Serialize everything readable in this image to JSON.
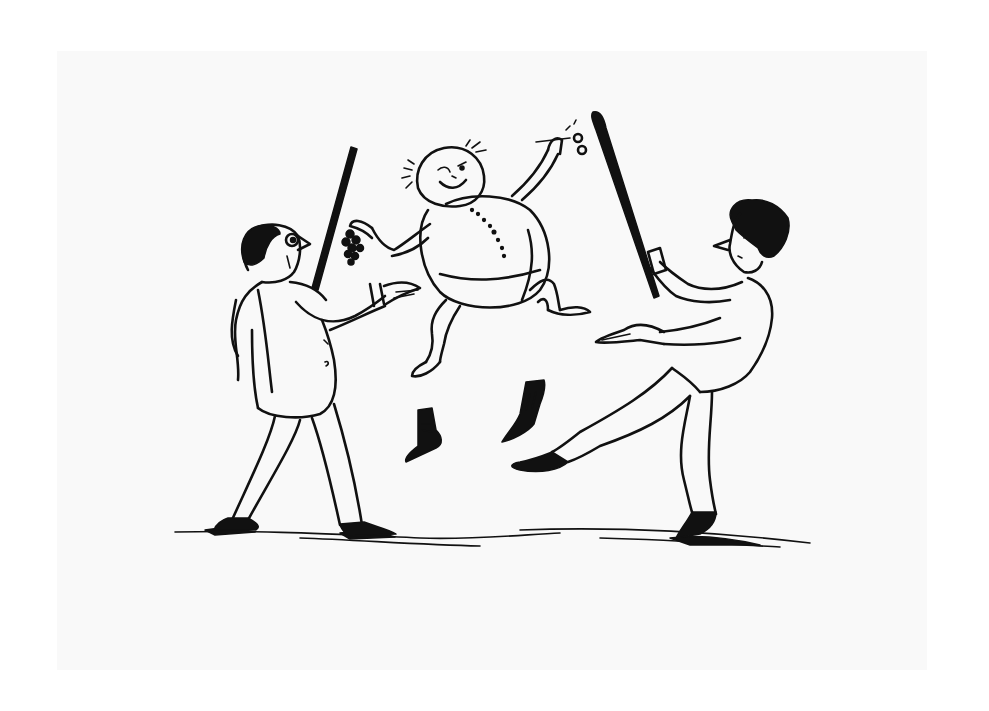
{
  "image": {
    "description": "Pen-and-ink cartoon: a round, smiling little man with a beach-ball body leaps in the air holding grapes and scissors, losing his boots, while two men with sticks lunge at him from either side.",
    "background_color": "#ffffff",
    "paper_color": "#f9f9f9",
    "ink_color": "#111111"
  },
  "figures": [
    {
      "id": "left-man",
      "description": "Balding man in jacket with stick, reaching out"
    },
    {
      "id": "jumping-man",
      "description": "Round-bodied smiling man mid-leap holding grapes and scissors"
    },
    {
      "id": "right-man",
      "description": "Curly-haired man swinging stick, kicking leg"
    }
  ],
  "objects": [
    "left-stick",
    "right-stick",
    "grapes",
    "scissors",
    "left-boot",
    "right-boot",
    "ground-shadow"
  ]
}
